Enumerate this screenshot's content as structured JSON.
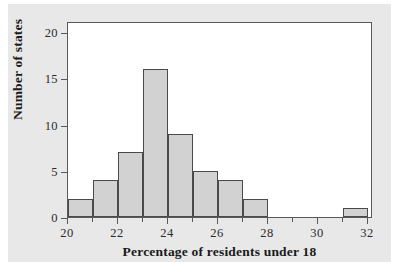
{
  "chart_data": {
    "type": "bar",
    "title": "",
    "xlabel": "Percentage of residents under 18",
    "ylabel": "Number of states",
    "xlim": [
      20,
      32.2
    ],
    "ylim": [
      0,
      21.2
    ],
    "xticks": [
      20,
      22,
      24,
      26,
      28,
      30,
      32
    ],
    "xtick_labels": [
      "20",
      "22",
      "24",
      "26",
      "28",
      "30",
      "32"
    ],
    "yticks": [
      0,
      5,
      10,
      15,
      20
    ],
    "ytick_labels": [
      "0",
      "5",
      "10",
      "15",
      "20"
    ],
    "grid": false,
    "legend": null,
    "bin_width": 1,
    "bin_edges": [
      20,
      21,
      22,
      23,
      24,
      25,
      26,
      27,
      28,
      29,
      30,
      31,
      32
    ],
    "categories": [
      "20-21",
      "21-22",
      "22-23",
      "23-24",
      "24-25",
      "25-26",
      "26-27",
      "27-28",
      "28-29",
      "29-30",
      "30-31",
      "31-32"
    ],
    "values": [
      2,
      4,
      7,
      16,
      9,
      5,
      4,
      2,
      0,
      0,
      0,
      1
    ],
    "bars": [
      {
        "x0": 20,
        "x1": 21,
        "value": 2
      },
      {
        "x0": 21,
        "x1": 22,
        "value": 4
      },
      {
        "x0": 22,
        "x1": 23,
        "value": 7
      },
      {
        "x0": 23,
        "x1": 24,
        "value": 16
      },
      {
        "x0": 24,
        "x1": 25,
        "value": 9
      },
      {
        "x0": 25,
        "x1": 26,
        "value": 5
      },
      {
        "x0": 26,
        "x1": 27,
        "value": 4
      },
      {
        "x0": 27,
        "x1": 28,
        "value": 2
      },
      {
        "x0": 31,
        "x1": 32,
        "value": 1
      }
    ],
    "colors": {
      "bar_fill": "#d2d2d2",
      "bar_edge": "#4a4a4a",
      "axis": "#595959",
      "text": "#1a1a1a",
      "plot_background": "#ffffff",
      "figure_background": "#e8e8e8"
    }
  }
}
